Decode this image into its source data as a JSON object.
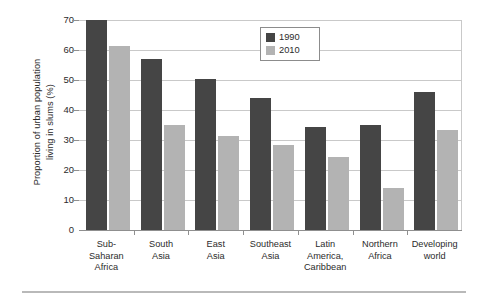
{
  "chart_data": {
    "type": "bar",
    "title": "",
    "xlabel": "",
    "ylabel": "Proportion of urban population living in slums (%)",
    "ylabel_lines": [
      "Proportion of urban population",
      "living in slums (%)"
    ],
    "ylim": [
      0,
      70
    ],
    "ytick_values": [
      0,
      10,
      20,
      30,
      40,
      50,
      60,
      70
    ],
    "ytick_labels": [
      "0",
      "10",
      "20",
      "30",
      "40",
      "50",
      "60",
      "70"
    ],
    "grid": true,
    "legend_position": "upper center",
    "categories": [
      "Sub-Saharan Africa",
      "South Asia",
      "East Asia",
      "Southeast Asia",
      "Latin America, Caribbean",
      "Northern Africa",
      "Developing world"
    ],
    "category_lines": [
      [
        "Sub-",
        "Saharan",
        "Africa"
      ],
      [
        "South",
        "Asia"
      ],
      [
        "East",
        "Asia"
      ],
      [
        "Southeast",
        "Asia"
      ],
      [
        "Latin",
        "America,",
        "Caribbean"
      ],
      [
        "Northern",
        "Africa"
      ],
      [
        "Developing",
        "world"
      ]
    ],
    "series": [
      {
        "name": "1990",
        "color": "#454545",
        "values": [
          70,
          57,
          50.5,
          44,
          34.5,
          35,
          46
        ]
      },
      {
        "name": "2010",
        "color": "#b3b3b3",
        "values": [
          61.5,
          35,
          31.5,
          28.5,
          24.5,
          14,
          33.5
        ]
      }
    ]
  },
  "legend": {
    "entries": [
      {
        "label": "1990",
        "color": "#454545"
      },
      {
        "label": "2010",
        "color": "#b3b3b3"
      }
    ]
  },
  "colors": {
    "series_1990": "#454545",
    "series_2010": "#b3b3b3",
    "gridline": "#c9c9c9",
    "axis": "#8f8f8f",
    "text": "#2b2b2b"
  }
}
